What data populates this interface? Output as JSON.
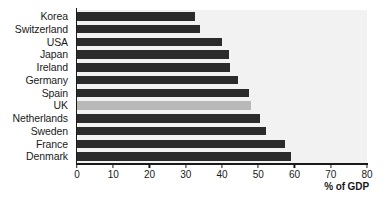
{
  "chart_data": {
    "type": "bar",
    "orientation": "horizontal",
    "title": "",
    "xlabel": "% of GDP",
    "ylabel": "",
    "xlim": [
      0,
      80
    ],
    "xticks": [
      0,
      10,
      20,
      30,
      40,
      50,
      60,
      70,
      80
    ],
    "grid": false,
    "legend": null,
    "categories": [
      "Korea",
      "Switzerland",
      "USA",
      "Japan",
      "Ireland",
      "Germany",
      "Spain",
      "UK",
      "Netherlands",
      "Sweden",
      "France",
      "Denmark"
    ],
    "values": [
      32.6,
      34.0,
      40.0,
      41.9,
      42.2,
      44.4,
      47.4,
      48.0,
      50.5,
      52.0,
      57.4,
      59.0
    ],
    "highlighted_category": "UK",
    "colors": {
      "bar": "#2b2b2b",
      "bar_highlight": "#b8b8b8",
      "plot_background": "#f2f2f2",
      "axis": "#1a1a1a",
      "page_background": "#ffffff"
    }
  }
}
